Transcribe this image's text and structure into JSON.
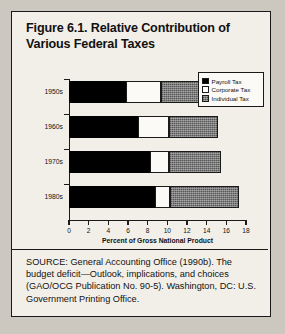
{
  "figure": {
    "title": "Figure 6.1. Relative Contribution of Various Federal Taxes",
    "source": "SOURCE: General Accounting Office (1990b). The budget deficit—Outlook, implications, and choices (GAO/OCG Publication No. 90-5). Washington, DC: U.S. Government Printing Office."
  },
  "chart_data": {
    "type": "bar",
    "orientation": "horizontal",
    "stacked": true,
    "title": "Figure 6.1. Relative Contribution of Various Federal Taxes",
    "xlabel": "Percent of Gross National Product",
    "ylabel": "",
    "xlim": [
      0,
      18
    ],
    "xticks": [
      0,
      2,
      4,
      6,
      8,
      10,
      12,
      14,
      16,
      18
    ],
    "xtick_labels": [
      "0",
      "2",
      "4",
      "6",
      "8",
      "10",
      "12",
      "14",
      "16",
      "18"
    ],
    "grid": false,
    "legend_position": "top-right",
    "categories": [
      "1950s",
      "1960s",
      "1970s",
      "1980s"
    ],
    "series": [
      {
        "name": "Payroll Tax",
        "color": "#000000",
        "values": [
          5.8,
          7.0,
          8.2,
          8.7
        ]
      },
      {
        "name": "Corporate Tax",
        "color": "#ffffff",
        "values": [
          3.6,
          3.2,
          2.0,
          1.6
        ]
      },
      {
        "name": "Individual Tax",
        "color": "#7c7c7c",
        "values": [
          4.4,
          5.0,
          5.3,
          7.0
        ]
      }
    ],
    "totals": [
      13.8,
      15.2,
      15.5,
      17.3
    ]
  },
  "legend": {
    "items": [
      {
        "label": "Payroll Tax",
        "swatch": "solid-black-swatch"
      },
      {
        "label": "Corporate Tax",
        "swatch": "open-white-swatch"
      },
      {
        "label": "Individual Tax",
        "swatch": "hatched-gray-swatch"
      }
    ]
  }
}
